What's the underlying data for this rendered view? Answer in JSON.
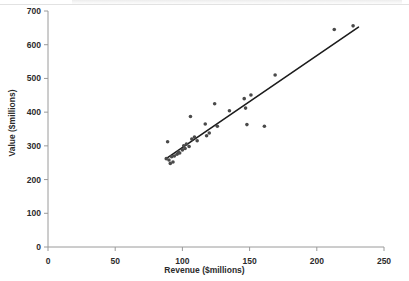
{
  "chart_data": {
    "type": "scatter",
    "title": "",
    "xlabel": "Revenue ($millions)",
    "ylabel": "Value ($millions)",
    "xlim": [
      0,
      250
    ],
    "ylim": [
      0,
      700
    ],
    "xticks": [
      0,
      50,
      100,
      150,
      200,
      250
    ],
    "yticks": [
      0,
      100,
      200,
      300,
      400,
      500,
      600,
      700
    ],
    "grid": false,
    "legend": null,
    "marker_color": "#4a4a4a",
    "trendline_color": "#1c1c1c",
    "points": [
      {
        "x": 88,
        "y": 262
      },
      {
        "x": 89,
        "y": 312
      },
      {
        "x": 90,
        "y": 258
      },
      {
        "x": 91,
        "y": 248
      },
      {
        "x": 92,
        "y": 268
      },
      {
        "x": 93,
        "y": 252
      },
      {
        "x": 94,
        "y": 270
      },
      {
        "x": 96,
        "y": 275
      },
      {
        "x": 97,
        "y": 282
      },
      {
        "x": 98,
        "y": 279
      },
      {
        "x": 100,
        "y": 288
      },
      {
        "x": 101,
        "y": 300
      },
      {
        "x": 102,
        "y": 292
      },
      {
        "x": 103,
        "y": 305
      },
      {
        "x": 105,
        "y": 298
      },
      {
        "x": 106,
        "y": 387
      },
      {
        "x": 107,
        "y": 320
      },
      {
        "x": 109,
        "y": 326
      },
      {
        "x": 111,
        "y": 315
      },
      {
        "x": 117,
        "y": 365
      },
      {
        "x": 118,
        "y": 330
      },
      {
        "x": 120,
        "y": 338
      },
      {
        "x": 124,
        "y": 425
      },
      {
        "x": 126,
        "y": 358
      },
      {
        "x": 135,
        "y": 404
      },
      {
        "x": 146,
        "y": 440
      },
      {
        "x": 147,
        "y": 412
      },
      {
        "x": 148,
        "y": 363
      },
      {
        "x": 151,
        "y": 451
      },
      {
        "x": 161,
        "y": 358
      },
      {
        "x": 169,
        "y": 510
      },
      {
        "x": 213,
        "y": 645
      },
      {
        "x": 227,
        "y": 656
      }
    ],
    "trendline": {
      "x_start": 89,
      "y_start": 265,
      "x_end": 231,
      "y_end": 652
    }
  }
}
